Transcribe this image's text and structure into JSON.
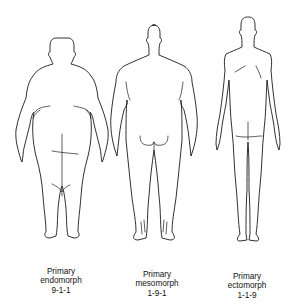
{
  "figure": {
    "type": "somatotype-comparison",
    "line_color": "#1a1a1a",
    "background": "#ffffff",
    "panels": [
      {
        "id": "endomorph",
        "title": "Primary",
        "type_name": "endomorph",
        "rating": "9-1-1",
        "view": "posterior"
      },
      {
        "id": "mesomorph",
        "title": "Primary",
        "type_name": "mesomorph",
        "rating": "1-9-1",
        "view": "posterior"
      },
      {
        "id": "ectomorph",
        "title": "Primary",
        "type_name": "ectomorph",
        "rating": "1-1-9",
        "view": "posterior"
      }
    ]
  }
}
